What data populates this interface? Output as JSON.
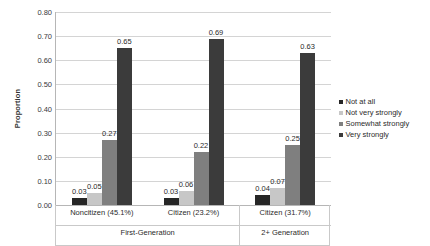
{
  "chart_data": {
    "type": "bar",
    "title": "",
    "xlabel": "",
    "ylabel": "Proportion",
    "ylim": [
      0.0,
      0.8
    ],
    "ytick_labels": [
      "0.80",
      "0.70",
      "0.60",
      "0.50",
      "0.40",
      "0.30",
      "0.20",
      "0.10",
      "0.00"
    ],
    "ytick_values": [
      0.8,
      0.7,
      0.6,
      0.5,
      0.4,
      0.3,
      0.2,
      0.1,
      0.0
    ],
    "grid": true,
    "legend_position": "right",
    "categories": [
      "Noncitizen (45.1%)",
      "Citizen (23.2%)",
      "Citizen (31.7%)"
    ],
    "group_labels": [
      "First-Generation",
      "2+ Generation"
    ],
    "group_spans": [
      2,
      1
    ],
    "series": [
      {
        "name": "Not at all",
        "color": "#262626",
        "values": [
          0.03,
          0.03,
          0.04
        ],
        "labels": [
          "0.03",
          "0.03",
          "0.04"
        ]
      },
      {
        "name": "Not very strongly",
        "color": "#c7c7c7",
        "values": [
          0.05,
          0.06,
          0.07
        ],
        "labels": [
          "0.05",
          "0.06",
          "0.07"
        ]
      },
      {
        "name": "Somewhat strongly",
        "color": "#7f7f7f",
        "values": [
          0.27,
          0.22,
          0.25
        ],
        "labels": [
          "0.27",
          "0.22",
          "0.25"
        ]
      },
      {
        "name": "Very strongly",
        "color": "#3b3b3b",
        "values": [
          0.65,
          0.69,
          0.63
        ],
        "labels": [
          "0.65",
          "0.69",
          "0.63"
        ]
      }
    ]
  },
  "legend": {
    "items": [
      {
        "label": "Not at all",
        "color": "#262626"
      },
      {
        "label": "Not very strongly",
        "color": "#c7c7c7"
      },
      {
        "label": "Somewhat strongly",
        "color": "#7f7f7f"
      },
      {
        "label": "Very strongly",
        "color": "#3b3b3b"
      }
    ]
  }
}
